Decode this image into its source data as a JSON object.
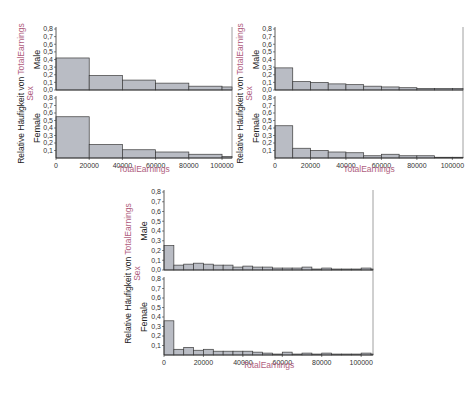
{
  "colors": {
    "bar_fill": "#b9bcc4",
    "bar_stroke": "#3a3a3a",
    "axis": "#333333",
    "accent": "#b06080"
  },
  "labels": {
    "y_label_prefix": "Relative Häufigkeit von ",
    "y_label_var": "TotalEarnings",
    "y_label_group": "Sex",
    "x_label": "TotalEarnings",
    "group_male": "Male",
    "group_female": "Female"
  },
  "chart_data": [
    {
      "type": "bar",
      "title": "",
      "xlabel": "TotalEarnings",
      "ylabel": "Relative Häufigkeit von TotalEarnings / Sex",
      "bin_width": 20000,
      "x_ticks": [
        0,
        20000,
        40000,
        60000,
        80000,
        100000
      ],
      "xlim": [
        0,
        106000
      ],
      "y_ticks_top": [
        "0,0",
        "0,1",
        "0,2",
        "0,3",
        "0,4",
        "0,5",
        "0,6",
        "0,7",
        "0,8"
      ],
      "y_ticks_bottom": [
        "0,1",
        "0,2",
        "0,3",
        "0,4",
        "0,5",
        "0,6",
        "0,7",
        "0,8"
      ],
      "ylim": [
        0,
        0.8
      ],
      "series": [
        {
          "name": "Male",
          "values": [
            0.42,
            0.19,
            0.13,
            0.09,
            0.05,
            0.04
          ]
        },
        {
          "name": "Female",
          "values": [
            0.55,
            0.18,
            0.11,
            0.08,
            0.05,
            0.02
          ]
        }
      ]
    },
    {
      "type": "bar",
      "title": "",
      "xlabel": "TotalEarnings",
      "ylabel": "Relative Häufigkeit von TotalEarnings / Sex",
      "bin_width": 10000,
      "x_ticks": [
        0,
        20000,
        40000,
        60000,
        80000,
        100000
      ],
      "xlim": [
        0,
        106000
      ],
      "y_ticks_top": [
        "0,0",
        "0,1",
        "0,2",
        "0,3",
        "0,4",
        "0,5",
        "0,6",
        "0,7",
        "0,8"
      ],
      "y_ticks_bottom": [
        "0,1",
        "0,2",
        "0,3",
        "0,4",
        "0,5",
        "0,6",
        "0,7",
        "0,8"
      ],
      "ylim": [
        0,
        0.8
      ],
      "series": [
        {
          "name": "Male",
          "values": [
            0.29,
            0.11,
            0.1,
            0.08,
            0.07,
            0.05,
            0.04,
            0.03,
            0.02,
            0.02,
            0.02
          ]
        },
        {
          "name": "Female",
          "values": [
            0.43,
            0.13,
            0.1,
            0.08,
            0.07,
            0.03,
            0.05,
            0.03,
            0.03,
            0.01,
            0.01
          ]
        }
      ]
    },
    {
      "type": "bar",
      "title": "",
      "xlabel": "TotalEarnings",
      "ylabel": "Relative Häufigkeit von TotalEarnings / Sex",
      "bin_width": 5000,
      "x_ticks": [
        0,
        20000,
        40000,
        60000,
        80000,
        100000
      ],
      "xlim": [
        0,
        106000
      ],
      "y_ticks_top": [
        "0,0",
        "0,1",
        "0,2",
        "0,3",
        "0,4",
        "0,5",
        "0,6",
        "0,7",
        "0,8"
      ],
      "y_ticks_bottom": [
        "0,1",
        "0,2",
        "0,3",
        "0,4",
        "0,5",
        "0,6",
        "0,7",
        "0,8"
      ],
      "ylim": [
        0,
        0.8
      ],
      "series": [
        {
          "name": "Male",
          "values": [
            0.25,
            0.05,
            0.06,
            0.07,
            0.06,
            0.05,
            0.05,
            0.03,
            0.04,
            0.03,
            0.03,
            0.02,
            0.02,
            0.02,
            0.03,
            0.01,
            0.02,
            0.01,
            0.01,
            0.01,
            0.02,
            0.01
          ]
        },
        {
          "name": "Female",
          "values": [
            0.36,
            0.06,
            0.08,
            0.05,
            0.06,
            0.04,
            0.04,
            0.04,
            0.04,
            0.03,
            0.02,
            0.01,
            0.03,
            0.01,
            0.02,
            0.01,
            0.02,
            0.01,
            0.01,
            0.01,
            0.02,
            0.01
          ]
        }
      ]
    }
  ]
}
